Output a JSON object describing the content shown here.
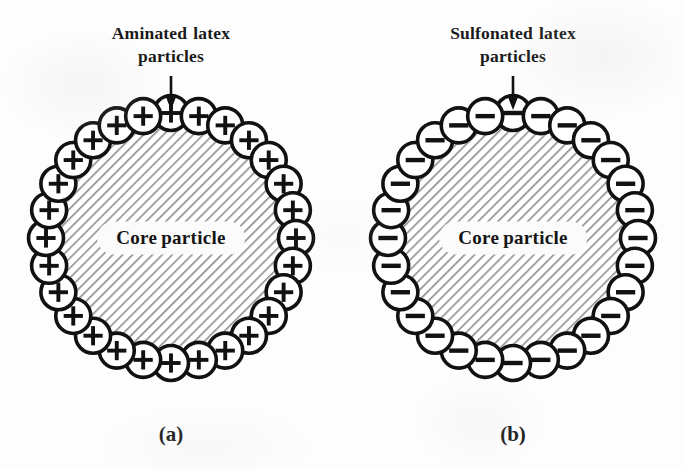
{
  "figure": {
    "type": "scientific-diagram",
    "background_color": "#fdfdfd",
    "ink_color": "#111111",
    "core_hatch_color": "#8a8a8a",
    "panels": [
      {
        "id": "a",
        "caption": "(a)",
        "heading_lines": [
          "Aminated  latex",
          "particles"
        ],
        "heading_words": [
          [
            "Aminated",
            "latex"
          ],
          [
            "particles"
          ]
        ],
        "annotation_target": "shell-particle",
        "core_label": "Core particle",
        "core_label_words": [
          "Core",
          "particle"
        ],
        "shell": {
          "charge_sign": "+",
          "charge_name": "positive",
          "count": 28,
          "fill": "#ffffff",
          "stroke": "#111111"
        },
        "core": {
          "fill": "#ffffff",
          "stroke": "#111111",
          "hatch_angle_deg": 45
        }
      },
      {
        "id": "b",
        "caption": "(b)",
        "heading_lines": [
          "Sulfonated  latex",
          "particles"
        ],
        "heading_words": [
          [
            "Sulfonated",
            "latex"
          ],
          [
            "particles"
          ]
        ],
        "annotation_target": "shell-particle",
        "core_label": "Core particle",
        "core_label_words": [
          "Core",
          "particle"
        ],
        "shell": {
          "charge_sign": "−",
          "charge_name": "negative",
          "count": 28,
          "fill": "#ffffff",
          "stroke": "#111111"
        },
        "core": {
          "fill": "#ffffff",
          "stroke": "#111111",
          "hatch_angle_deg": 45
        }
      }
    ]
  }
}
